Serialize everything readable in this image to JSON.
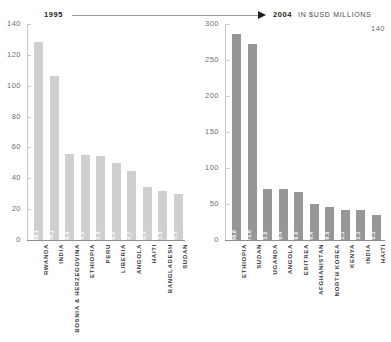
{
  "header": {
    "year_left": "1995",
    "year_right": "2004",
    "unit_label": "IN $USD MILLIONS",
    "arrow_icon": "right-triangle-arrow"
  },
  "chart_data": [
    {
      "type": "bar",
      "title": "1995",
      "xlabel": "",
      "ylabel": "",
      "ylim": [
        0,
        140
      ],
      "yticks": [
        140,
        120,
        100,
        80,
        60,
        40,
        20,
        0
      ],
      "grid": false,
      "legend": "none",
      "bar_color": "#cfcfcf",
      "categories": [
        "RWANDA",
        "INDIA",
        "BOSNIA & HERZEGOVINA",
        "ETHIOPIA",
        "PERU",
        "LIBERIA",
        "ANGOLA",
        "HAITI",
        "BANGLADESH",
        "SUDAN"
      ],
      "values": [
        128.1,
        106.1,
        56.0,
        54.9,
        54.5,
        50.0,
        44.7,
        34.4,
        31.5,
        30.1
      ],
      "value_labels": [
        "128.1",
        "106.1",
        "56.0",
        "54.9",
        "54.5",
        "50.0",
        "44.7",
        "34.4",
        "31.5",
        "30.1"
      ]
    },
    {
      "type": "bar",
      "title": "2004",
      "xlabel": "",
      "ylabel": "IN $USD MILLIONS",
      "ylim": [
        0,
        300
      ],
      "yticks": [
        300,
        250,
        200,
        150,
        100,
        50,
        0
      ],
      "stray_tick_label": "140",
      "grid": false,
      "legend": "none",
      "bar_color": "#969696",
      "categories": [
        "ETHIOPIA",
        "SUDAN",
        "UGANDA",
        "ANGOLA",
        "ERITREA",
        "AFGHANISTAN",
        "NORTH KOREA",
        "KENYA",
        "INDIA",
        "HAITI"
      ],
      "values": [
        286.6,
        271.6,
        71.0,
        70.4,
        66.0,
        50.4,
        46.5,
        42.1,
        42.1,
        35.1
      ],
      "value_labels": [
        "286.6",
        "271.6",
        "71.0",
        "70.4",
        "66.0",
        "50.4",
        "46.5",
        "42.1",
        "42.1",
        "35.1"
      ]
    }
  ]
}
